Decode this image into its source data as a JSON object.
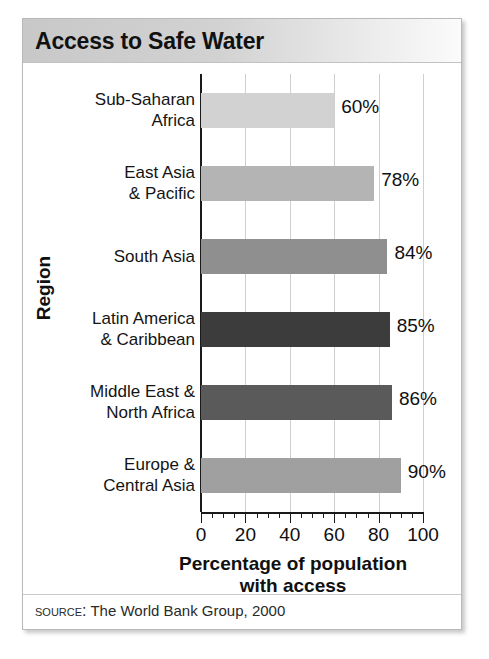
{
  "chart_data": {
    "type": "bar",
    "orientation": "horizontal",
    "title": "Access to Safe Water",
    "xlabel": "Percentage of population\nwith access",
    "ylabel": "Region",
    "categories": [
      "Sub-Saharan Africa",
      "East Asia & Pacific",
      "South Asia",
      "Latin America & Caribbean",
      "Middle East & North Africa",
      "Europe & Central Asia"
    ],
    "values": [
      60,
      78,
      84,
      85,
      86,
      90
    ],
    "value_labels": [
      "60%",
      "78%",
      "84%",
      "85%",
      "86%",
      "90%"
    ],
    "xlim": [
      0,
      100
    ],
    "xticks": [
      0,
      20,
      40,
      60,
      80,
      100
    ],
    "xtick_labels": [
      "0",
      "20",
      "40",
      "60",
      "80",
      "100"
    ],
    "minor_tick_interval": 5,
    "grid": "vertical-major",
    "legend": "none",
    "bar_colors": [
      "#d2d2d2",
      "#b4b4b4",
      "#8f8f8f",
      "#3c3c3c",
      "#5a5a5a",
      "#a0a0a0"
    ],
    "source": "The World Bank Group, 2000"
  },
  "title": {
    "text": "Access to Safe Water"
  },
  "axes": {
    "x_title_line1": "Percentage of population",
    "x_title_line2": "with access",
    "y_title": "Region"
  },
  "categories": [
    {
      "line1": "Sub-Saharan",
      "line2": "Africa"
    },
    {
      "line1": "East Asia",
      "line2": "& Pacific"
    },
    {
      "line1": "South Asia",
      "line2": ""
    },
    {
      "line1": "Latin America",
      "line2": "& Caribbean"
    },
    {
      "line1": "Middle East &",
      "line2": "North Africa"
    },
    {
      "line1": "Europe &",
      "line2": "Central Asia"
    }
  ],
  "ticks": {
    "labels": [
      "0",
      "20",
      "40",
      "60",
      "80",
      "100"
    ]
  },
  "values": {
    "labels": [
      "60%",
      "78%",
      "84%",
      "85%",
      "86%",
      "90%"
    ]
  },
  "source": {
    "keyword": "Source:",
    "text": "The World Bank Group, 2000"
  }
}
